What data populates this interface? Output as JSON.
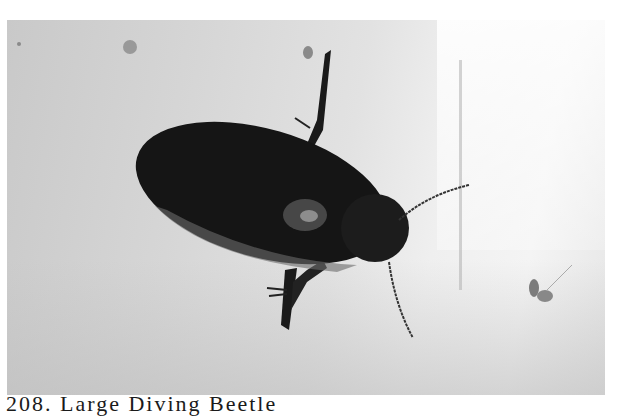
{
  "image": {
    "subject": "Large diving beetle on a pale surface",
    "colors": {
      "background": "#ffffff",
      "photo_tone": "#d4d4d4",
      "beetle": "#141414"
    }
  },
  "caption": {
    "text": "208. Large Diving Beetle"
  }
}
